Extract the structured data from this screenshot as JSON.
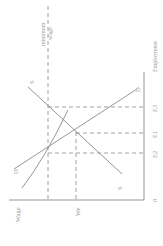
{
  "diagram": {
    "rotation_deg": -90,
    "axes": {
      "y_label": "Wage",
      "x_label": "Employment",
      "origin_label": "0"
    },
    "lines": {
      "supply_label_top": "S",
      "supply_label_bottom": "S",
      "demand_label_top": "D",
      "demand_label_bottom": "D"
    },
    "markers": {
      "minimum_wage_label_line1": "minimum",
      "minimum_wage_label_line2": "wage",
      "equilibrium_wage_label": "We",
      "e1_label": "E1",
      "e2_label": "E2",
      "e3_label": "E3"
    },
    "colors": {
      "line": "#8a8a8a",
      "dashed": "#8a8a8a",
      "text": "#9a9a9a",
      "background": "#ffffff"
    }
  }
}
